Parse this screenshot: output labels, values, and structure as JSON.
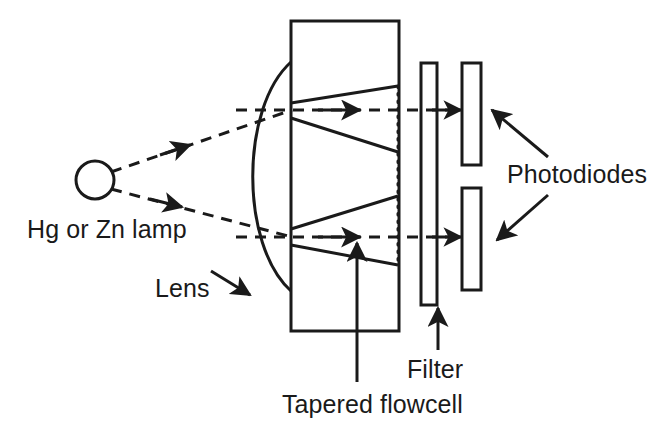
{
  "figure": {
    "background_color": "#ffffff",
    "stroke_color": "#1a1a1a",
    "text_color": "#1a1a1a"
  },
  "labels": {
    "lamp": "Hg or Zn lamp",
    "lens": "Lens",
    "photodiodes": "Photodiodes",
    "filter": "Filter",
    "flowcell": "Tapered flowcell"
  },
  "components": {
    "lamp": {
      "name": "lamp-source",
      "shape": "circle",
      "cx": 95,
      "cy": 180,
      "r": 19
    },
    "lens": {
      "name": "lens",
      "shape": "arc",
      "x_top": 291,
      "y_top": 62,
      "x_bottom": 291,
      "y_bottom": 291,
      "bulge_x": 247
    },
    "flowcell": {
      "name": "tapered-flowcell",
      "shape": "rect",
      "x": 291,
      "y": 21,
      "width": 108,
      "height": 310
    },
    "filter": {
      "name": "filter",
      "shape": "rect",
      "x": 421,
      "y": 63,
      "width": 16,
      "height": 242
    },
    "photodiode_upper": {
      "name": "photodiode-upper",
      "shape": "rect",
      "x": 462,
      "y": 63,
      "width": 19,
      "height": 102
    },
    "photodiode_lower": {
      "name": "photodiode-lower",
      "shape": "rect",
      "x": 462,
      "y": 188,
      "width": 19,
      "height": 102
    }
  },
  "beams": {
    "upper_ray_y": 110,
    "lower_ray_y": 237,
    "style": "dashed",
    "source_x": 110,
    "end_x": 462
  }
}
